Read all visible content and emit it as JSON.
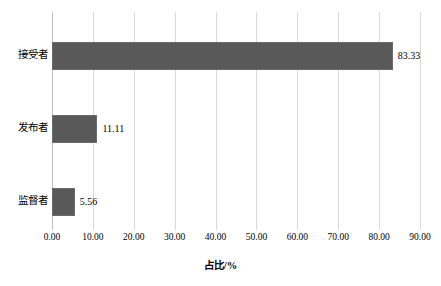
{
  "chart_data": {
    "type": "bar",
    "orientation": "horizontal",
    "title": "",
    "subtitle": "",
    "categories": [
      "接受者",
      "发布者",
      "监督者"
    ],
    "values": [
      83.33,
      11.11,
      5.56
    ],
    "data_labels": [
      "83.33",
      "11.11",
      "5.56"
    ],
    "series": [
      {
        "name": "",
        "values": [
          83.33,
          11.11,
          5.56
        ]
      }
    ],
    "xlabel": "占比/%",
    "ylabel": "",
    "xlim": [
      0,
      90
    ],
    "ylim": [
      0,
      3
    ],
    "xticks": [
      0,
      10,
      20,
      30,
      40,
      50,
      60,
      70,
      80,
      90
    ],
    "xtick_labels": [
      "0.00",
      "10.00",
      "20.00",
      "30.00",
      "40.00",
      "50.00",
      "60.00",
      "70.00",
      "80.00",
      "90.00"
    ],
    "ytick_labels": [
      "接受者",
      "发布者",
      "监督者"
    ],
    "grid": "vertical",
    "legend": false,
    "legend_position": "none",
    "colors": {
      "bar_fill": "#595959",
      "bar_stroke": "#6b6b6b",
      "gridline": "#d9d9d9",
      "axis_line": "#bfbfbf",
      "background": "#ffffff",
      "text": "#000000"
    }
  }
}
